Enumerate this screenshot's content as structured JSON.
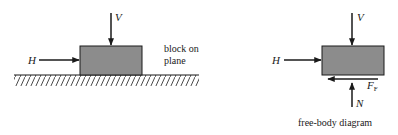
{
  "colors": {
    "block_fill": "#8c8c8c",
    "stroke": "#1a1a1a",
    "background": "#ffffff"
  },
  "left_diagram": {
    "force_vertical_label": "V",
    "force_horizontal_label": "H",
    "caption_line1": "block on",
    "caption_line2": "plane"
  },
  "right_diagram": {
    "force_vertical_label": "V",
    "force_horizontal_label": "H",
    "friction_label": "F",
    "friction_subscript": "F",
    "normal_label": "N",
    "caption": "free-body diagram"
  }
}
